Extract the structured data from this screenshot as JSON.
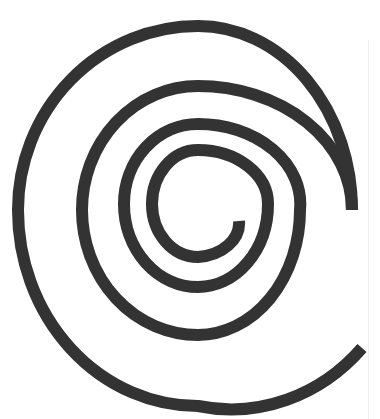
{
  "image": {
    "subject": "spiral",
    "description": "Black thick-stroke spiral on white background, winding clockwise outward from center",
    "background_color": "#ffffff",
    "stroke_color": "#333333",
    "stroke_width": 12,
    "turns": 4
  }
}
